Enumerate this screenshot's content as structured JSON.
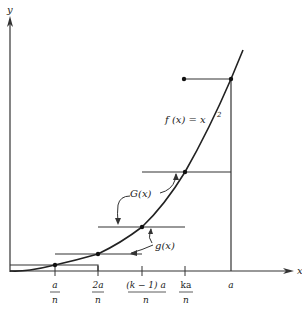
{
  "diagram": {
    "axes": {
      "x_label": "x",
      "y_label": "y"
    },
    "curve_label": "f(x) = x²",
    "curve_label_parts": {
      "lhs": "f (x)  =  x",
      "exp": "2"
    },
    "upper_step_label": "G(x)",
    "lower_step_label": "g(x)",
    "ticks": [
      {
        "id": "a_over_n",
        "num": "a",
        "den": "n"
      },
      {
        "id": "2a_over_n",
        "num": "2a",
        "den": "n"
      },
      {
        "id": "k_minus_1_a_over_n",
        "num": "(k − 1) a",
        "den": "n"
      },
      {
        "id": "ka_over_n",
        "num": "ka",
        "den": "n"
      },
      {
        "id": "a",
        "num": "a",
        "den": ""
      }
    ],
    "colors": {
      "line": "#222222",
      "axis": "#333333",
      "background": "#ffffff"
    }
  }
}
